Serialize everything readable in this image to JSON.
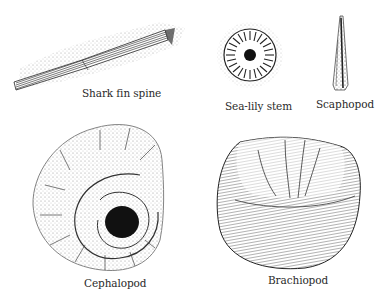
{
  "figure": {
    "background": "#ffffff",
    "ink": "#1a1a1a",
    "specimens": [
      {
        "id": "shark-fin-spine",
        "label": "Shark fin spine"
      },
      {
        "id": "sea-lily-stem",
        "label": "Sea-lily stem"
      },
      {
        "id": "scaphopod",
        "label": "Scaphopod"
      },
      {
        "id": "cephalopod",
        "label": "Cephalopod"
      },
      {
        "id": "brachiopod",
        "label": "Brachiopod"
      }
    ]
  }
}
